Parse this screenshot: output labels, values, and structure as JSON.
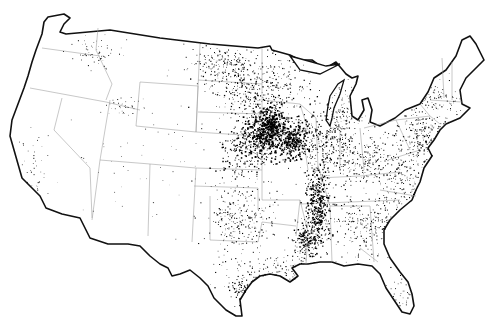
{
  "map": {
    "type": "dot-density",
    "region": "Contiguous United States",
    "colors": {
      "background": "#ffffff",
      "outline": "#111111",
      "state_borders": "#9a9a9a",
      "dots": "#000000"
    },
    "seed": 7,
    "dot_clusters": [
      {
        "name": "iowa-missouri-core",
        "cx": 268,
        "cy": 128,
        "rx": 16,
        "ry": 18,
        "count": 520,
        "size": 1.3
      },
      {
        "name": "iowa-east",
        "cx": 292,
        "cy": 140,
        "rx": 14,
        "ry": 16,
        "count": 300,
        "size": 1.2
      },
      {
        "name": "nebraska-kansas",
        "cx": 248,
        "cy": 150,
        "rx": 22,
        "ry": 20,
        "count": 260,
        "size": 1.0
      },
      {
        "name": "upper-midwest",
        "cx": 262,
        "cy": 90,
        "rx": 40,
        "ry": 30,
        "count": 420,
        "size": 0.9
      },
      {
        "name": "dakotas",
        "cx": 222,
        "cy": 62,
        "rx": 28,
        "ry": 16,
        "count": 180,
        "size": 0.8
      },
      {
        "name": "illinois-indiana",
        "cx": 325,
        "cy": 140,
        "rx": 25,
        "ry": 30,
        "count": 320,
        "size": 0.9
      },
      {
        "name": "mississippi-corridor",
        "cx": 318,
        "cy": 205,
        "rx": 10,
        "ry": 35,
        "count": 420,
        "size": 1.1
      },
      {
        "name": "mississippi-south",
        "cx": 305,
        "cy": 240,
        "rx": 9,
        "ry": 18,
        "count": 180,
        "size": 1.0
      },
      {
        "name": "oklahoma-texas",
        "cx": 240,
        "cy": 215,
        "rx": 28,
        "ry": 35,
        "count": 300,
        "size": 0.8
      },
      {
        "name": "gulf-coast",
        "cx": 290,
        "cy": 270,
        "rx": 50,
        "ry": 12,
        "count": 180,
        "size": 0.8
      },
      {
        "name": "southeast",
        "cx": 370,
        "cy": 225,
        "rx": 40,
        "ry": 25,
        "count": 320,
        "size": 0.8
      },
      {
        "name": "carolinas-virginia",
        "cx": 410,
        "cy": 180,
        "rx": 30,
        "ry": 25,
        "count": 260,
        "size": 0.8
      },
      {
        "name": "ohio-valley",
        "cx": 365,
        "cy": 160,
        "rx": 25,
        "ry": 22,
        "count": 220,
        "size": 0.8
      },
      {
        "name": "mid-atlantic",
        "cx": 420,
        "cy": 135,
        "rx": 22,
        "ry": 22,
        "count": 200,
        "size": 0.9
      },
      {
        "name": "northeast",
        "cx": 435,
        "cy": 100,
        "rx": 25,
        "ry": 20,
        "count": 130,
        "size": 0.8
      },
      {
        "name": "michigan",
        "cx": 348,
        "cy": 110,
        "rx": 16,
        "ry": 18,
        "count": 100,
        "size": 0.7
      },
      {
        "name": "pacific-northwest",
        "cx": 95,
        "cy": 52,
        "rx": 18,
        "ry": 12,
        "count": 60,
        "size": 0.7
      },
      {
        "name": "idaho",
        "cx": 125,
        "cy": 105,
        "rx": 14,
        "ry": 8,
        "count": 40,
        "size": 0.7
      },
      {
        "name": "california",
        "cx": 35,
        "cy": 170,
        "rx": 14,
        "ry": 30,
        "count": 40,
        "size": 0.7
      },
      {
        "name": "east-texas",
        "cx": 245,
        "cy": 290,
        "rx": 12,
        "ry": 12,
        "count": 100,
        "size": 0.9
      },
      {
        "name": "florida",
        "cx": 400,
        "cy": 290,
        "rx": 15,
        "ry": 20,
        "count": 40,
        "size": 0.7
      },
      {
        "name": "west-scatter",
        "cx": 140,
        "cy": 150,
        "rx": 70,
        "ry": 55,
        "count": 60,
        "size": 0.6
      }
    ]
  }
}
